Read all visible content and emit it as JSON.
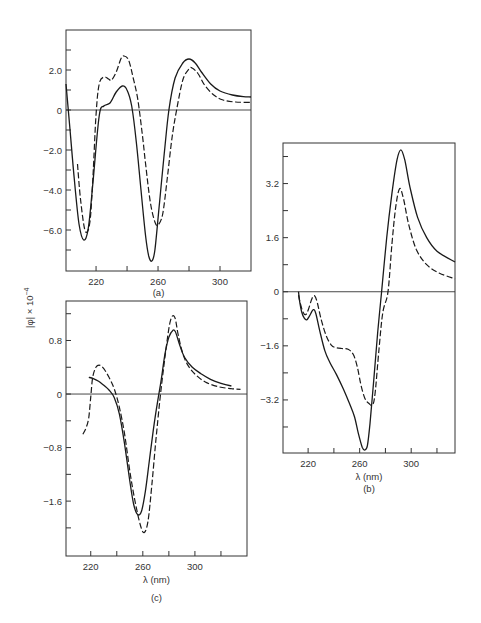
{
  "figure": {
    "ylabel": "[φ] × 10⁻⁴",
    "ylabel_text": "|φ| × 10",
    "ylabel_exp": "−4"
  },
  "chart_data": [
    {
      "type": "line",
      "panel": "(a)",
      "caption": "(a)",
      "title": "",
      "xlabel": "",
      "ylabel": "[φ] × 10⁻⁴",
      "xlim": [
        200.6,
        320
      ],
      "ylim": [
        -8.05,
        4.0
      ],
      "x_ticks": [
        220,
        240,
        260,
        280,
        300
      ],
      "x_tick_labels": [
        "220",
        "260",
        "300"
      ],
      "y_ticks": [
        3.0,
        2.0,
        1.0,
        0,
        -1.0,
        -2.0,
        -3.0,
        -4.0,
        -5.0,
        -6.0,
        -7.0
      ],
      "y_tick_labels": [
        "2.0",
        "0",
        "−2.0",
        "−4.0",
        "−6.0"
      ],
      "zero_line": true,
      "grid": false,
      "legend": null,
      "series": [
        {
          "name": "solid",
          "style": "solid",
          "x": [
            200.6,
            203,
            206,
            209,
            212,
            215,
            218,
            222,
            225,
            229,
            233,
            237,
            240,
            243,
            246,
            249,
            252,
            254,
            256,
            258,
            261,
            264,
            267,
            271,
            276,
            280,
            284,
            288,
            294,
            300,
            308,
            315,
            320
          ],
          "y": [
            1.3,
            -0.8,
            -3.5,
            -5.7,
            -6.5,
            -5.9,
            -3.6,
            -0.3,
            0.2,
            0.35,
            0.9,
            1.2,
            1.0,
            0.2,
            -1.6,
            -4.0,
            -6.3,
            -7.3,
            -7.55,
            -7.0,
            -4.6,
            -2.2,
            0.0,
            1.6,
            2.35,
            2.55,
            2.35,
            1.9,
            1.3,
            0.95,
            0.75,
            0.67,
            0.65
          ]
        },
        {
          "name": "dashed",
          "style": "dashed",
          "x": [
            208,
            210,
            213,
            216,
            218,
            220,
            222,
            225,
            228,
            230,
            233,
            236,
            238,
            241,
            244,
            247,
            250,
            252,
            255,
            258,
            260,
            263,
            266,
            269,
            272,
            276,
            280,
            282,
            286,
            290,
            296,
            302,
            310,
            320
          ],
          "y": [
            -2.7,
            -4.5,
            -6.05,
            -5.6,
            -3.3,
            -0.2,
            1.3,
            1.65,
            1.55,
            1.5,
            1.9,
            2.55,
            2.7,
            2.5,
            1.6,
            0.5,
            -1.3,
            -2.7,
            -4.6,
            -5.6,
            -5.75,
            -5.2,
            -3.4,
            -1.4,
            0.0,
            1.5,
            2.05,
            2.1,
            1.8,
            1.25,
            0.75,
            0.5,
            0.4,
            0.38
          ]
        }
      ]
    },
    {
      "type": "line",
      "panel": "(b)",
      "caption": "(b)",
      "title": "",
      "xlabel": "λ (nm)",
      "ylabel": "[φ] × 10⁻⁴",
      "xlim": [
        200.5,
        334
      ],
      "ylim": [
        -4.77,
        4.4
      ],
      "x_ticks": [
        220,
        240,
        260,
        280,
        300,
        320
      ],
      "x_tick_labels": [
        "220",
        "260",
        "300"
      ],
      "y_ticks": [
        4.0,
        3.2,
        2.4,
        1.6,
        0.8,
        0,
        -0.8,
        -1.6,
        -2.4,
        -3.2,
        -4.0
      ],
      "y_tick_labels": [
        "3.2",
        "1.6",
        "0",
        "−1.6",
        "−3.2"
      ],
      "zero_line": true,
      "grid": false,
      "legend": null,
      "series": [
        {
          "name": "solid",
          "style": "solid",
          "x": [
            212.5,
            213.5,
            215,
            217,
            219,
            221,
            224,
            226,
            229,
            233,
            237,
            242,
            247,
            252,
            256,
            259,
            262,
            264,
            266,
            268,
            271,
            274,
            277,
            281,
            285,
            289,
            292,
            295,
            299,
            305,
            312,
            320,
            334
          ],
          "y": [
            0.0,
            -0.3,
            -0.6,
            -0.78,
            -0.83,
            -0.72,
            -0.53,
            -0.65,
            -1.15,
            -1.75,
            -2.1,
            -2.45,
            -2.85,
            -3.3,
            -3.7,
            -4.2,
            -4.6,
            -4.68,
            -4.55,
            -3.9,
            -2.6,
            -1.2,
            0.0,
            1.6,
            2.9,
            3.9,
            4.2,
            3.9,
            3.1,
            2.2,
            1.6,
            1.2,
            0.88
          ]
        },
        {
          "name": "dashed",
          "style": "dashed",
          "x": [
            212.5,
            214,
            216,
            218,
            220,
            223,
            225,
            227,
            230,
            234,
            238,
            241,
            246,
            251,
            255,
            258,
            261,
            264,
            267,
            270,
            272,
            275,
            278,
            282,
            285,
            288,
            291,
            294,
            298,
            304,
            312,
            322,
            334
          ],
          "y": [
            -0.1,
            -0.35,
            -0.6,
            -0.68,
            -0.55,
            -0.2,
            -0.12,
            -0.3,
            -0.8,
            -1.3,
            -1.58,
            -1.65,
            -1.68,
            -1.7,
            -1.85,
            -2.2,
            -2.75,
            -3.15,
            -3.3,
            -3.35,
            -3.0,
            -1.7,
            -0.6,
            0.0,
            1.4,
            2.5,
            3.05,
            2.75,
            2.0,
            1.25,
            0.8,
            0.55,
            0.38
          ]
        }
      ]
    },
    {
      "type": "line",
      "panel": "(c)",
      "caption": "(c)",
      "title": "",
      "xlabel": "λ (nm)",
      "ylabel": "[φ] × 10⁻⁴",
      "xlim": [
        201,
        340
      ],
      "ylim": [
        -2.42,
        1.39
      ],
      "x_ticks": [
        220,
        240,
        260,
        280,
        300,
        320
      ],
      "x_tick_labels": [
        "220",
        "260",
        "300"
      ],
      "y_ticks": [
        1.2,
        0.8,
        0.4,
        0,
        -0.4,
        -0.8,
        -1.2,
        -1.6,
        -2.0
      ],
      "y_tick_labels": [
        "0.8",
        "0",
        "−0.8",
        "−1.6"
      ],
      "zero_line": true,
      "grid": false,
      "legend": null,
      "series": [
        {
          "name": "solid",
          "style": "solid",
          "x": [
            218.5,
            222,
            226,
            230,
            234,
            238,
            242,
            246,
            250,
            253,
            256,
            259,
            262,
            265,
            268,
            271,
            274,
            277,
            280,
            283,
            285,
            288,
            292,
            298,
            305,
            312,
            320,
            328
          ],
          "y": [
            0.25,
            0.23,
            0.19,
            0.13,
            0.06,
            -0.05,
            -0.3,
            -0.75,
            -1.3,
            -1.65,
            -1.8,
            -1.75,
            -1.45,
            -1.0,
            -0.55,
            -0.15,
            0.2,
            0.6,
            0.85,
            0.95,
            0.93,
            0.75,
            0.55,
            0.4,
            0.3,
            0.22,
            0.16,
            0.12
          ]
        },
        {
          "name": "dashed",
          "style": "dashed",
          "x": [
            214,
            216.5,
            218.5,
            220,
            221.5,
            224,
            227,
            230,
            234,
            238,
            242,
            246,
            250,
            254,
            258,
            261,
            264,
            267,
            270,
            273,
            276,
            279,
            281,
            283,
            285,
            287,
            290,
            294,
            300,
            308,
            318,
            328,
            335
          ],
          "y": [
            -0.6,
            -0.5,
            -0.35,
            -0.05,
            0.25,
            0.4,
            0.43,
            0.38,
            0.25,
            0.08,
            -0.2,
            -0.6,
            -1.15,
            -1.6,
            -1.95,
            -2.07,
            -1.9,
            -1.35,
            -0.7,
            -0.1,
            0.4,
            0.85,
            1.08,
            1.17,
            1.12,
            0.9,
            0.65,
            0.45,
            0.3,
            0.18,
            0.11,
            0.08,
            0.07
          ]
        }
      ]
    }
  ],
  "layout": {
    "panels": [
      {
        "left": 66,
        "top": 30,
        "right": 251,
        "bottom": 271
      },
      {
        "left": 283,
        "top": 143,
        "right": 455,
        "bottom": 453
      },
      {
        "left": 66,
        "top": 301,
        "right": 247,
        "bottom": 556
      }
    ]
  }
}
